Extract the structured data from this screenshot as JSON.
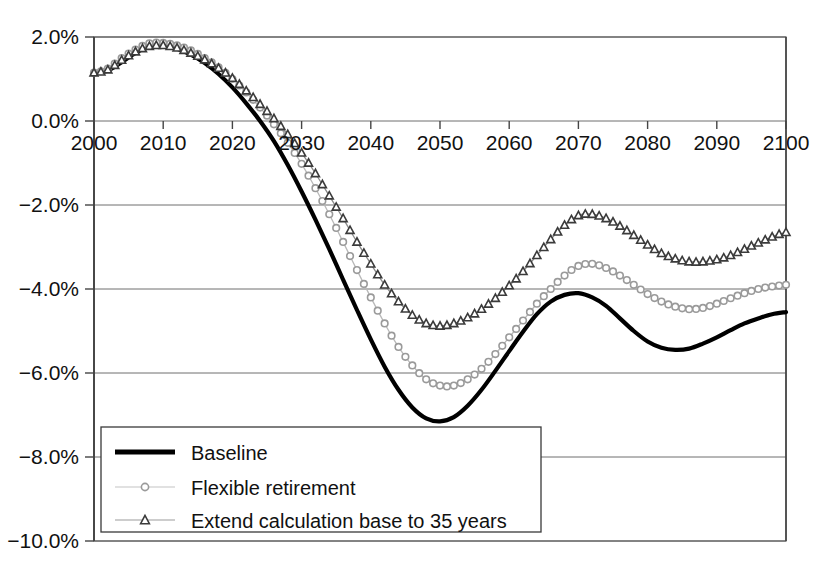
{
  "chart_data": {
    "type": "line",
    "title": "",
    "subtitle": "",
    "xlabel": "",
    "ylabel": "",
    "xlim": [
      2000,
      2100
    ],
    "ylim": [
      -10.0,
      2.0
    ],
    "grid": true,
    "legend_position": "bottom-left",
    "x_tick_labels": [
      "2000",
      "2010",
      "2020",
      "2030",
      "2040",
      "2050",
      "2060",
      "2070",
      "2080",
      "2090",
      "2100"
    ],
    "x_ticks": [
      2000,
      2010,
      2020,
      2030,
      2040,
      2050,
      2060,
      2070,
      2080,
      2090,
      2100
    ],
    "y_tick_labels": [
      "2.0%",
      "0.0%",
      "−2.0%",
      "−4.0%",
      "−6.0%",
      "−8.0%",
      "−10.0%"
    ],
    "y_ticks": [
      2.0,
      0.0,
      -2.0,
      -4.0,
      -6.0,
      -8.0,
      -10.0
    ],
    "y_unit": "%",
    "x": [
      2000,
      2002,
      2004,
      2006,
      2008,
      2010,
      2012,
      2014,
      2016,
      2018,
      2020,
      2022,
      2024,
      2026,
      2028,
      2030,
      2032,
      2034,
      2036,
      2038,
      2040,
      2042,
      2044,
      2046,
      2048,
      2050,
      2052,
      2054,
      2056,
      2058,
      2060,
      2062,
      2064,
      2066,
      2068,
      2070,
      2072,
      2074,
      2076,
      2078,
      2080,
      2082,
      2084,
      2086,
      2088,
      2090,
      2092,
      2094,
      2096,
      2098,
      2100
    ],
    "series": [
      {
        "name": "Baseline",
        "marker": "none",
        "color": "#000000",
        "line_width": "thick",
        "values": [
          1.15,
          1.2,
          1.4,
          1.62,
          1.78,
          1.8,
          1.72,
          1.58,
          1.38,
          1.12,
          0.8,
          0.42,
          0.0,
          -0.48,
          -1.05,
          -1.68,
          -2.35,
          -3.05,
          -3.78,
          -4.5,
          -5.2,
          -5.85,
          -6.4,
          -6.82,
          -7.08,
          -7.15,
          -7.05,
          -6.78,
          -6.4,
          -5.95,
          -5.48,
          -5.02,
          -4.6,
          -4.3,
          -4.14,
          -4.1,
          -4.2,
          -4.4,
          -4.7,
          -5.0,
          -5.25,
          -5.4,
          -5.45,
          -5.42,
          -5.3,
          -5.15,
          -4.98,
          -4.82,
          -4.7,
          -4.6,
          -4.55
        ]
      },
      {
        "name": "Flexible retirement",
        "marker": "circle",
        "color": "#9a9a9a",
        "line_width": "thin",
        "values": [
          1.15,
          1.25,
          1.5,
          1.7,
          1.85,
          1.86,
          1.8,
          1.68,
          1.5,
          1.28,
          1.0,
          0.68,
          0.32,
          -0.08,
          -0.52,
          -1.02,
          -1.6,
          -2.22,
          -2.88,
          -3.55,
          -4.2,
          -4.82,
          -5.38,
          -5.82,
          -6.15,
          -6.3,
          -6.3,
          -6.15,
          -5.9,
          -5.55,
          -5.15,
          -4.75,
          -4.35,
          -4.0,
          -3.68,
          -3.45,
          -3.4,
          -3.5,
          -3.68,
          -3.9,
          -4.12,
          -4.3,
          -4.42,
          -4.48,
          -4.45,
          -4.35,
          -4.22,
          -4.1,
          -4.0,
          -3.94,
          -3.9
        ]
      },
      {
        "name": "Extend calculation base to 35 years",
        "marker": "triangle",
        "color": "#3b3b3b",
        "line_width": "thin",
        "values": [
          1.15,
          1.22,
          1.45,
          1.65,
          1.78,
          1.8,
          1.74,
          1.62,
          1.46,
          1.26,
          1.02,
          0.72,
          0.4,
          0.06,
          -0.32,
          -0.76,
          -1.25,
          -1.78,
          -2.32,
          -2.88,
          -3.4,
          -3.9,
          -4.3,
          -4.62,
          -4.82,
          -4.88,
          -4.82,
          -4.68,
          -4.48,
          -4.22,
          -3.92,
          -3.58,
          -3.2,
          -2.82,
          -2.48,
          -2.25,
          -2.22,
          -2.32,
          -2.5,
          -2.72,
          -2.95,
          -3.15,
          -3.28,
          -3.35,
          -3.35,
          -3.3,
          -3.2,
          -3.05,
          -2.9,
          -2.76,
          -2.65
        ]
      }
    ],
    "legend": [
      {
        "label": "Baseline",
        "marker": "none",
        "color": "#000000"
      },
      {
        "label": "Flexible retirement",
        "marker": "circle",
        "color": "#9a9a9a"
      },
      {
        "label": "Extend calculation base to 35 years",
        "marker": "triangle",
        "color": "#3b3b3b"
      }
    ]
  }
}
